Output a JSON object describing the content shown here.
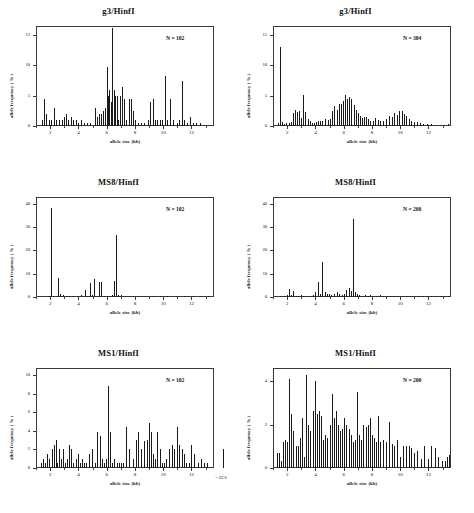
{
  "figure": {
    "axis_labels": {
      "x": "allele size (kb)",
      "y": "allele frequency ( % )"
    }
  },
  "chart_data": [
    {
      "id": "g3-hinfi-left",
      "type": "bar",
      "title": "g3/HinfI",
      "annotation": "N = 102",
      "xlabel": "allele size (kb)",
      "ylabel": "allele frequency ( % )",
      "xlim": [
        1.0,
        13.6
      ],
      "ylim": [
        0,
        16.5
      ],
      "xticks": [
        2,
        4,
        6,
        8,
        10,
        12
      ],
      "yticks": [
        0,
        5,
        10,
        15
      ],
      "grid": false,
      "x": [
        1.45,
        1.6,
        1.72,
        1.9,
        2.05,
        2.25,
        2.45,
        2.6,
        2.85,
        3.0,
        3.15,
        3.3,
        3.45,
        3.6,
        3.8,
        3.95,
        4.15,
        4.4,
        4.6,
        4.85,
        5.15,
        5.3,
        5.45,
        5.6,
        5.75,
        5.9,
        6.0,
        6.1,
        6.2,
        6.3,
        6.4,
        6.5,
        6.6,
        6.7,
        6.8,
        6.95,
        7.1,
        7.25,
        7.4,
        7.55,
        7.7,
        7.85,
        8.0,
        8.2,
        8.4,
        8.65,
        8.9,
        9.1,
        9.3,
        9.45,
        9.6,
        9.8,
        9.95,
        10.1,
        10.25,
        10.45,
        10.7,
        10.95,
        11.15,
        11.35,
        11.5,
        11.7,
        11.9,
        12.1,
        12.35,
        12.6
      ],
      "y": [
        0.98,
        4.41,
        1.96,
        0.98,
        0.98,
        2.94,
        0.98,
        0.98,
        0.98,
        1.47,
        1.96,
        0.98,
        1.47,
        0.98,
        0.98,
        0.49,
        0.98,
        0.49,
        0.49,
        0.49,
        2.94,
        1.47,
        1.96,
        1.96,
        2.45,
        2.94,
        9.8,
        4.9,
        5.88,
        3.92,
        16.2,
        5.88,
        4.9,
        4.9,
        0.98,
        5.0,
        6.37,
        4.41,
        0.98,
        4.41,
        4.41,
        2.45,
        0.98,
        0.49,
        0.49,
        0.49,
        0.98,
        3.92,
        4.41,
        0.98,
        0.98,
        0.98,
        0.98,
        8.33,
        0.98,
        4.41,
        0.98,
        0.49,
        0.98,
        7.35,
        0.98,
        0.49,
        1.47,
        0.49,
        0.49,
        0.49
      ]
    },
    {
      "id": "g3-hinfi-right",
      "type": "bar",
      "title": "g3/HinfI",
      "annotation": "N = 384",
      "xlabel": "allele size (kb)",
      "ylabel": "allele frequency ( % )",
      "xlim": [
        1.0,
        13.6
      ],
      "ylim": [
        0,
        16.5
      ],
      "xticks": [
        2,
        4,
        6,
        8,
        10,
        12
      ],
      "yticks": [
        0,
        5,
        10,
        15
      ],
      "grid": false,
      "x": [
        1.35,
        1.5,
        1.65,
        1.8,
        1.95,
        2.1,
        2.25,
        2.4,
        2.55,
        2.7,
        2.85,
        3.0,
        3.15,
        3.3,
        3.45,
        3.6,
        3.75,
        3.9,
        4.05,
        4.2,
        4.35,
        4.5,
        4.7,
        4.9,
        5.05,
        5.2,
        5.35,
        5.5,
        5.65,
        5.8,
        5.95,
        6.1,
        6.25,
        6.4,
        6.55,
        6.7,
        6.85,
        7.0,
        7.15,
        7.3,
        7.45,
        7.6,
        7.75,
        7.9,
        8.05,
        8.2,
        8.4,
        8.6,
        8.8,
        9.0,
        9.2,
        9.4,
        9.6,
        9.8,
        9.95,
        10.1,
        10.25,
        10.4,
        10.6,
        10.8,
        11.0,
        11.2,
        11.4,
        11.65,
        11.9,
        12.2,
        12.5,
        12.8,
        13.1,
        13.4
      ],
      "y": [
        0.5,
        13.0,
        0.6,
        0.4,
        0.5,
        0.5,
        0.6,
        2.1,
        2.6,
        2.3,
        2.4,
        1.4,
        5.2,
        2.3,
        1.1,
        0.8,
        0.5,
        0.5,
        0.6,
        0.8,
        0.9,
        0.9,
        1.1,
        1.0,
        1.2,
        2.4,
        3.3,
        2.7,
        3.6,
        3.7,
        4.1,
        5.2,
        4.4,
        4.8,
        4.5,
        3.4,
        2.6,
        2.1,
        1.6,
        1.4,
        1.5,
        1.5,
        1.1,
        0.9,
        0.8,
        1.3,
        1.0,
        0.9,
        0.9,
        1.1,
        1.6,
        1.5,
        2.2,
        1.9,
        2.4,
        2.4,
        2.0,
        1.7,
        1.2,
        0.9,
        0.7,
        0.6,
        0.5,
        0.4,
        0.3,
        0.3,
        0.2,
        0.2,
        0.2,
        0.3
      ]
    },
    {
      "id": "ms8-hinfi-left",
      "type": "bar",
      "title": "MS8/HinfI",
      "annotation": "N = 102",
      "xlabel": "allele size (kb)",
      "ylabel": "allele frequency ( % )",
      "xlim": [
        1.0,
        13.6
      ],
      "ylim": [
        0,
        43
      ],
      "xticks": [
        2,
        4,
        6,
        8,
        10,
        12
      ],
      "yticks": [
        0,
        10,
        20,
        30,
        40
      ],
      "grid": false,
      "x": [
        1.9,
        2.05,
        2.2,
        2.4,
        2.55,
        2.7,
        2.9,
        3.1,
        3.35,
        3.6,
        3.9,
        4.2,
        4.45,
        4.6,
        4.8,
        4.95,
        5.1,
        5.3,
        5.45,
        5.6,
        5.8,
        6.0,
        6.2,
        6.35,
        6.5,
        6.65,
        6.8,
        7.0,
        7.3,
        7.6,
        7.9,
        8.2,
        8.5,
        8.9,
        9.3,
        9.8,
        10.3,
        10.9,
        11.5,
        12.1,
        12.7,
        13.2
      ],
      "y": [
        0.5,
        38.2,
        0.5,
        0.5,
        8.3,
        1.5,
        1.0,
        0.5,
        0.5,
        0.5,
        0.5,
        1.0,
        2.9,
        0.5,
        5.9,
        1.0,
        7.8,
        0.5,
        6.4,
        6.4,
        0.5,
        0.5,
        0.5,
        1.0,
        6.9,
        26.5,
        1.0,
        1.0,
        0.5,
        0.5,
        0.5,
        0.5,
        0.5,
        0.5,
        0.5,
        0.5,
        0.5,
        0.5,
        0.5,
        0.5,
        0.5,
        0.5
      ]
    },
    {
      "id": "ms8-hinfi-right",
      "type": "bar",
      "title": "MS8/HinfI",
      "annotation": "N = 200",
      "xlabel": "allele size (kb)",
      "ylabel": "allele frequency ( % )",
      "xlim": [
        1.0,
        13.6
      ],
      "ylim": [
        0,
        43
      ],
      "xticks": [
        2,
        4,
        6,
        8,
        10,
        12
      ],
      "yticks": [
        0,
        10,
        20,
        30,
        40
      ],
      "grid": false,
      "x": [
        1.5,
        1.75,
        2.0,
        2.15,
        2.3,
        2.45,
        2.6,
        2.75,
        2.95,
        3.15,
        3.35,
        3.55,
        3.8,
        4.0,
        4.2,
        4.35,
        4.5,
        4.65,
        4.8,
        4.95,
        5.1,
        5.3,
        5.5,
        5.7,
        5.9,
        6.05,
        6.2,
        6.35,
        6.5,
        6.65,
        6.8,
        6.95,
        7.1,
        7.3,
        7.5,
        7.7,
        7.9,
        8.1,
        8.3,
        8.55,
        8.8,
        9.0,
        9.25,
        9.5,
        9.8,
        10.1,
        10.4,
        10.7,
        11.0,
        11.3,
        11.6,
        11.9,
        12.2,
        12.5,
        12.8,
        13.1,
        13.4
      ],
      "y": [
        0.5,
        0.5,
        1.0,
        3.5,
        1.0,
        2.5,
        0.5,
        0.5,
        1.0,
        0.5,
        0.5,
        0.5,
        1.0,
        2.0,
        6.5,
        1.5,
        15.0,
        2.0,
        1.5,
        1.5,
        1.0,
        1.5,
        2.0,
        1.5,
        1.0,
        1.5,
        3.0,
        4.0,
        2.5,
        33.5,
        2.0,
        1.5,
        1.0,
        0.5,
        1.0,
        0.5,
        1.0,
        0.5,
        0.5,
        1.0,
        0.5,
        0.5,
        0.5,
        0.5,
        0.5,
        0.5,
        0.5,
        0.5,
        0.5,
        0.5,
        0.5,
        0.5,
        0.5,
        0.5,
        0.5,
        0.5,
        0.5
      ]
    },
    {
      "id": "ms1-hinfi-left",
      "type": "bar",
      "title": "MS1/HinfI",
      "annotation": "N = 102",
      "xlabel": "allele size (kb)",
      "ylabel": "allele frequency ( % )",
      "xlim": [
        1.0,
        13.6
      ],
      "ylim": [
        0,
        10.8
      ],
      "xticks": [
        2,
        4,
        6,
        8,
        10,
        12
      ],
      "yticks": [
        0,
        2,
        4,
        6,
        8,
        10
      ],
      "offscale_label": "> 22.6",
      "offscale_value": 2.0,
      "grid": false,
      "x": [
        1.35,
        1.5,
        1.65,
        1.8,
        1.95,
        2.1,
        2.25,
        2.4,
        2.5,
        2.6,
        2.75,
        2.9,
        3.05,
        3.2,
        3.35,
        3.5,
        3.65,
        3.8,
        3.95,
        4.1,
        4.25,
        4.4,
        4.55,
        4.75,
        4.95,
        5.15,
        5.35,
        5.5,
        5.65,
        5.8,
        5.95,
        6.1,
        6.25,
        6.4,
        6.55,
        6.7,
        6.85,
        7.0,
        7.15,
        7.35,
        7.6,
        7.85,
        8.05,
        8.25,
        8.45,
        8.65,
        8.85,
        9.0,
        9.15,
        9.3,
        9.45,
        9.6,
        9.75,
        9.9,
        10.05,
        10.2,
        10.4,
        10.6,
        10.8,
        11.0,
        11.15,
        11.3,
        11.45,
        11.6,
        11.8,
        12.0,
        12.2,
        12.45,
        12.7,
        12.9,
        13.1
      ],
      "y": [
        0.5,
        1.0,
        0.5,
        1.5,
        1.0,
        2.0,
        2.5,
        3.0,
        0.5,
        2.0,
        1.0,
        2.0,
        0.5,
        1.0,
        2.5,
        2.0,
        0.5,
        1.0,
        1.5,
        0.5,
        1.0,
        0.5,
        0.5,
        1.5,
        2.0,
        0.5,
        3.9,
        3.5,
        1.0,
        0.5,
        1.0,
        8.9,
        3.9,
        0.5,
        1.0,
        0.5,
        0.5,
        0.5,
        0.5,
        4.4,
        2.0,
        1.0,
        3.0,
        3.9,
        2.0,
        2.9,
        3.0,
        4.9,
        3.9,
        1.5,
        1.0,
        3.9,
        2.0,
        0.5,
        0.5,
        1.0,
        2.0,
        2.5,
        2.0,
        4.4,
        2.5,
        2.0,
        1.5,
        0.5,
        0.5,
        2.5,
        1.5,
        0.5,
        1.0,
        0.5,
        0.5
      ]
    },
    {
      "id": "ms1-hinfi-right",
      "type": "bar",
      "title": "MS1/HinfI",
      "annotation": "N = 200",
      "xlabel": "allele size (kb)",
      "ylabel": "allele frequency ( % )",
      "xlim": [
        1.0,
        13.6
      ],
      "ylim": [
        0,
        4.6
      ],
      "xticks": [
        2,
        4,
        6,
        8,
        10,
        12
      ],
      "yticks": [
        0,
        2,
        4
      ],
      "grid": false,
      "x": [
        1.25,
        1.4,
        1.55,
        1.7,
        1.85,
        2.0,
        2.15,
        2.3,
        2.45,
        2.6,
        2.75,
        2.9,
        3.05,
        3.2,
        3.35,
        3.5,
        3.65,
        3.8,
        3.95,
        4.1,
        4.25,
        4.4,
        4.55,
        4.7,
        4.85,
        5.0,
        5.15,
        5.3,
        5.45,
        5.6,
        5.75,
        5.9,
        6.05,
        6.2,
        6.35,
        6.5,
        6.65,
        6.8,
        6.95,
        7.1,
        7.25,
        7.4,
        7.55,
        7.7,
        7.85,
        8.0,
        8.15,
        8.3,
        8.45,
        8.6,
        8.8,
        9.0,
        9.2,
        9.4,
        9.6,
        9.8,
        10.0,
        10.2,
        10.4,
        10.6,
        10.8,
        11.0,
        11.2,
        11.45,
        11.7,
        11.95,
        12.2,
        12.45,
        12.7,
        12.95,
        13.2,
        13.35,
        13.45
      ],
      "y": [
        0.7,
        0.7,
        0.3,
        1.2,
        1.3,
        1.2,
        4.1,
        2.5,
        1.7,
        1.0,
        1.0,
        1.4,
        2.3,
        0.5,
        4.3,
        2.0,
        1.7,
        2.6,
        4.0,
        2.5,
        2.6,
        2.4,
        1.3,
        1.5,
        1.4,
        2.0,
        3.4,
        2.3,
        2.6,
        2.0,
        1.7,
        1.8,
        2.3,
        2.0,
        1.8,
        1.5,
        1.2,
        1.3,
        3.5,
        1.5,
        1.3,
        2.0,
        1.9,
        2.0,
        2.3,
        1.5,
        1.4,
        1.2,
        2.4,
        1.2,
        1.3,
        1.2,
        2.1,
        1.1,
        1.0,
        1.3,
        0.5,
        1.0,
        1.0,
        1.0,
        0.9,
        0.7,
        0.8,
        0.4,
        1.0,
        0.4,
        1.0,
        0.9,
        0.5,
        0.3,
        0.3,
        0.5,
        0.6
      ]
    }
  ]
}
